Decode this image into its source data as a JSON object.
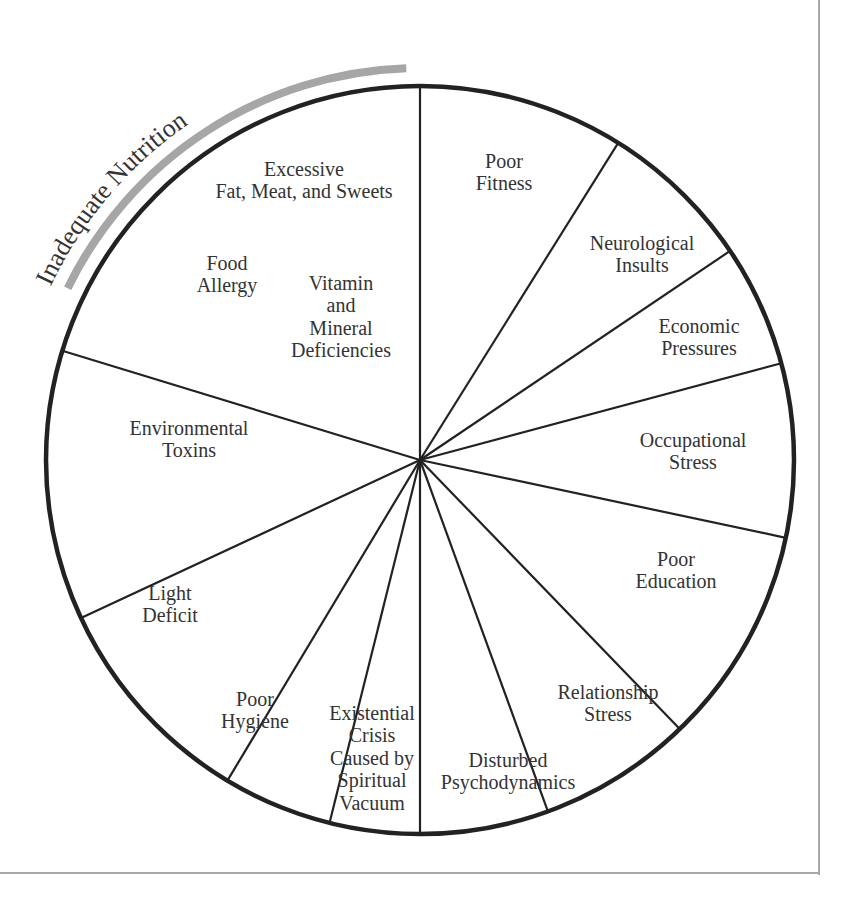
{
  "diagram": {
    "type": "wheel",
    "center": [
      420,
      460
    ],
    "radius": 374,
    "rim_color": "#222222",
    "spoke_color": "#222222",
    "arc_color": "#a6a6a6",
    "label_color": "#333333",
    "label_font_size": 20,
    "arc_label": {
      "text": "Inadequate Nutrition",
      "start_angle_deg": 206,
      "end_angle_deg": 268,
      "radius": 392,
      "text_radius": 408
    },
    "spokes_deg": [
      -90,
      -58,
      -34,
      -15,
      12,
      46,
      70,
      90,
      104,
      121,
      155,
      197
    ],
    "segments": [
      {
        "id": "inadequate-nutrition",
        "lines": []
      },
      {
        "id": "poor-fitness",
        "lines": [
          "Poor",
          "Fitness"
        ],
        "pos": [
          504,
          168
        ]
      },
      {
        "id": "neurological-insults",
        "lines": [
          "Neurological",
          "Insults"
        ],
        "pos": [
          642,
          250
        ]
      },
      {
        "id": "economic-pressures",
        "lines": [
          "Economic",
          "Pressures"
        ],
        "pos": [
          699,
          333
        ]
      },
      {
        "id": "occupational-stress",
        "lines": [
          "Occupational",
          "Stress"
        ],
        "pos": [
          693,
          447
        ]
      },
      {
        "id": "poor-education",
        "lines": [
          "Poor",
          "Education"
        ],
        "pos": [
          676,
          566
        ]
      },
      {
        "id": "relationship-stress",
        "lines": [
          "Relationship",
          "Stress"
        ],
        "pos": [
          608,
          699
        ]
      },
      {
        "id": "disturbed-psychodynamics",
        "lines": [
          "Disturbed",
          "Psychodynamics"
        ],
        "pos": [
          508,
          767
        ]
      },
      {
        "id": "existential-crisis",
        "lines": [
          "Existential",
          "Crisis",
          "Caused by",
          "Spiritual",
          "Vacuum"
        ],
        "pos": [
          372,
          720
        ]
      },
      {
        "id": "poor-hygiene",
        "lines": [
          "Poor",
          "Hygiene"
        ],
        "pos": [
          255,
          706
        ]
      },
      {
        "id": "light-deficit",
        "lines": [
          "Light",
          "Deficit"
        ],
        "pos": [
          170,
          600
        ]
      },
      {
        "id": "environmental-toxins",
        "lines": [
          "Environmental",
          "Toxins"
        ],
        "pos": [
          189,
          435
        ]
      }
    ],
    "nutrition_labels": [
      {
        "id": "excessive-fat-meat-sweets",
        "lines": [
          "Excessive",
          "Fat, Meat, and Sweets"
        ],
        "pos": [
          304,
          176
        ]
      },
      {
        "id": "food-allergy",
        "lines": [
          "Food",
          "Allergy"
        ],
        "pos": [
          227,
          270
        ]
      },
      {
        "id": "vitamin-mineral-deficiencies",
        "lines": [
          "Vitamin",
          "and",
          "Mineral",
          "Deficiencies"
        ],
        "pos": [
          341,
          290
        ]
      }
    ]
  }
}
